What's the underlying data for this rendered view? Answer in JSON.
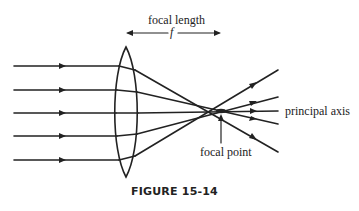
{
  "diagram": {
    "title": "FIGURE 15-14",
    "labels": {
      "focal_length": "focal length",
      "f_symbol": "f",
      "principal_axis": "principal axis",
      "focal_point": "focal point"
    },
    "elements": {
      "lens": "converging-lens",
      "incident_rays": 5,
      "ray_direction": "left-to-right"
    },
    "colors": {
      "ink": "#222222",
      "background": "#ffffff"
    }
  }
}
